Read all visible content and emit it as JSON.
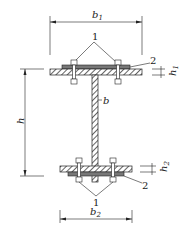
{
  "diagram": {
    "title": "",
    "labels": {
      "b1": {
        "main": "b",
        "sub": "1"
      },
      "b2": {
        "main": "b",
        "sub": "2"
      },
      "h": "h",
      "h1": {
        "main": "h",
        "sub": "1"
      },
      "h2": {
        "main": "h",
        "sub": "2"
      },
      "b": "b",
      "callout_bolt": "1",
      "callout_plate": "2"
    },
    "parts": [
      {
        "id": "1",
        "name": "bolt"
      },
      {
        "id": "2",
        "name": "steel plate"
      }
    ],
    "colors": {
      "line": "#222222",
      "plate": "#777777",
      "background": "#ffffff"
    }
  }
}
